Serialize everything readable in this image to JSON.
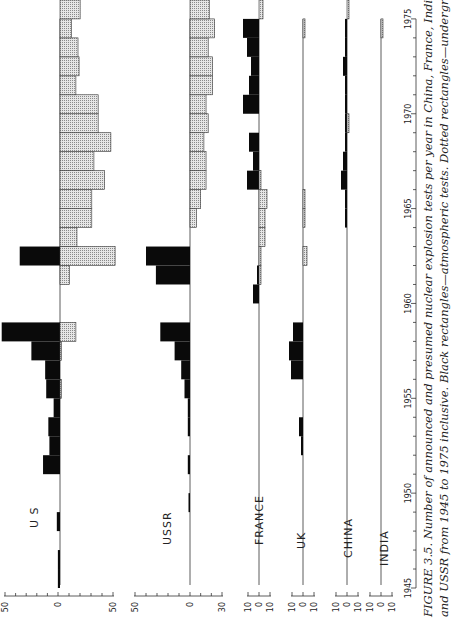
{
  "caption": {
    "line1": "FIGURE 3.5. Number of announced and presumed nuclear explosion tests per year in China, France, India, UK, US",
    "line2": "and USSR from 1945 to 1975 inclusive. Black rectangles—atmospheric tests. Dotted rectangles—underground tests."
  },
  "chart_data": {
    "type": "bar",
    "orientation": "rotated 90° counter-clockwise (years run bottom-to-top, counts horizontal)",
    "title": "Number of announced and presumed nuclear explosion tests per year",
    "xlabel": "Year",
    "ylabel": "Number of tests",
    "x_ticks": [
      "1945",
      "1950",
      "1955",
      "1960",
      "1965",
      "1970",
      "1975"
    ],
    "x_range": [
      1945,
      1975
    ],
    "legend": [
      {
        "name": "Atmospheric tests",
        "style": "black rectangles"
      },
      {
        "name": "Underground tests",
        "style": "dotted rectangles"
      }
    ],
    "panels": [
      {
        "country": "U S",
        "axis_ticks": [
          "50",
          "0",
          "50"
        ],
        "atmospheric": {
          "1945": 2,
          "1946": 2,
          "1948": 3,
          "1951": 16,
          "1952": 10,
          "1953": 11,
          "1954": 6,
          "1955": 13,
          "1956": 14,
          "1957": 27,
          "1958": 55,
          "1962": 38
        },
        "underground": {
          "1955": 1,
          "1957": 1,
          "1958": 15,
          "1961": 9,
          "1962": 52,
          "1963": 16,
          "1964": 30,
          "1965": 30,
          "1966": 42,
          "1967": 32,
          "1968": 48,
          "1969": 36,
          "1970": 36,
          "1971": 15,
          "1972": 18,
          "1973": 17,
          "1974": 11,
          "1975": 19
        }
      },
      {
        "country": "USSR",
        "axis_ticks": [
          "50",
          "0",
          "30"
        ],
        "atmospheric": {
          "1949": 1,
          "1951": 2,
          "1953": 2,
          "1954": 2,
          "1955": 5,
          "1956": 8,
          "1957": 14,
          "1958": 27,
          "1961": 31,
          "1962": 40
        },
        "underground": {
          "1964": 6,
          "1965": 10,
          "1966": 15,
          "1967": 15,
          "1968": 13,
          "1969": 17,
          "1970": 15,
          "1971": 21,
          "1972": 21,
          "1973": 17,
          "1974": 23,
          "1975": 18
        }
      },
      {
        "country": "FRANCE",
        "axis_ticks": [
          "10",
          "0",
          "10"
        ],
        "atmospheric": {
          "1960": 3,
          "1961": 1,
          "1966": 6,
          "1967": 3,
          "1968": 5,
          "1970": 8,
          "1971": 5,
          "1972": 4,
          "1973": 6,
          "1974": 8
        },
        "underground": {
          "1961": 1,
          "1962": 1,
          "1963": 3,
          "1964": 3,
          "1965": 4,
          "1966": 1,
          "1975": 2
        }
      },
      {
        "country": "UK",
        "axis_ticks": [
          "10",
          "0",
          "10"
        ],
        "atmospheric": {
          "1952": 1,
          "1953": 2,
          "1956": 6,
          "1957": 7,
          "1958": 5
        },
        "underground": {
          "1962": 2,
          "1964": 1,
          "1965": 1,
          "1974": 1
        }
      },
      {
        "country": "CHINA",
        "axis_ticks": [
          "10",
          "0",
          "10"
        ],
        "atmospheric": {
          "1964": 1,
          "1965": 1,
          "1966": 3,
          "1967": 2,
          "1968": 1,
          "1969": 1,
          "1970": 1,
          "1971": 1,
          "1972": 2,
          "1973": 1,
          "1974": 1
        },
        "underground": {
          "1969": 1,
          "1975": 1
        }
      },
      {
        "country": "INDIA",
        "axis_ticks": [
          "10",
          "0",
          "10"
        ],
        "atmospheric": {},
        "underground": {
          "1974": 1
        }
      }
    ]
  }
}
